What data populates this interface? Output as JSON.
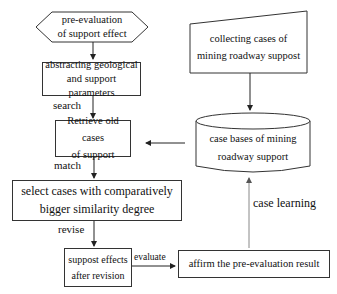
{
  "diagram": {
    "nodes": {
      "pre_evaluation": {
        "line1": "pre-evaluation",
        "line2": "of support effect",
        "shape": "hexagon"
      },
      "abstracting": {
        "line1": "abstracting geological",
        "line2": "and support parameters",
        "shape": "rectangle"
      },
      "retrieve": {
        "line1": "Retrieve old cases",
        "line2": "of support",
        "shape": "rectangle"
      },
      "select": {
        "line1": "select cases with comparatively",
        "line2": "bigger similarity degree",
        "shape": "rectangle"
      },
      "support_effects": {
        "line1": "suppost effects",
        "line2": "after revision",
        "shape": "rectangle"
      },
      "affirm": {
        "line1": "affirm the pre-evaluation result",
        "shape": "rectangle"
      },
      "collecting": {
        "line1": "collecting cases of",
        "line2": "mining roadway suppost",
        "shape": "manual-input"
      },
      "case_bases": {
        "line1": "case bases of mining",
        "line2": "roadway support",
        "shape": "cylinder"
      }
    },
    "edge_labels": {
      "search": "search",
      "match": "match",
      "revise": "revise",
      "evaluate": "evaluate",
      "case_learning": "case learning"
    },
    "colors": {
      "stroke": "#333333",
      "learning_arrow": "#888888"
    }
  }
}
